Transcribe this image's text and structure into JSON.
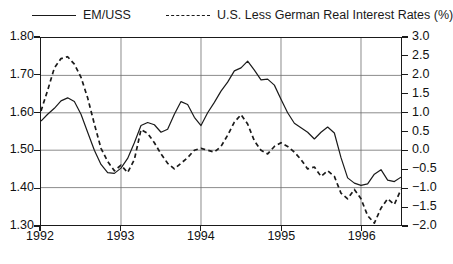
{
  "legend": {
    "entries": [
      {
        "label": "EM/USS",
        "style": "solid",
        "color": "#1a1a1a",
        "name": "legend-entry-emuss"
      },
      {
        "label": "U.S. Less German Real Interest Rates (%)",
        "style": "dashed",
        "color": "#1a1a1a",
        "name": "legend-entry-rates"
      }
    ]
  },
  "chart_data": {
    "type": "line",
    "title": "",
    "subtitle": "",
    "xlabel": "",
    "ylabel": "",
    "grid": true,
    "legend_position": "top",
    "x": [
      1992.0,
      1992.083,
      1992.167,
      1992.25,
      1992.333,
      1992.417,
      1992.5,
      1992.583,
      1992.667,
      1992.75,
      1992.833,
      1992.917,
      1993.0,
      1993.083,
      1993.167,
      1993.25,
      1993.333,
      1993.417,
      1993.5,
      1993.583,
      1993.667,
      1993.75,
      1993.833,
      1993.917,
      1994.0,
      1994.083,
      1994.167,
      1994.25,
      1994.333,
      1994.417,
      1994.5,
      1994.583,
      1994.667,
      1994.75,
      1994.833,
      1994.917,
      1995.0,
      1995.083,
      1995.167,
      1995.25,
      1995.333,
      1995.417,
      1995.5,
      1995.583,
      1995.667,
      1995.75,
      1995.833,
      1995.917,
      1996.0,
      1996.083,
      1996.167,
      1996.25,
      1996.333,
      1996.417,
      1996.5
    ],
    "x_tick_labels": [
      "1992",
      "1993",
      "1994",
      "1995",
      "1996"
    ],
    "x_tick_values": [
      1992,
      1993,
      1994,
      1995,
      1996
    ],
    "xlim": [
      1992.0,
      1996.5
    ],
    "axes": [
      {
        "id": "left",
        "series_name": "EM/USS",
        "ylim": [
          1.3,
          1.8
        ],
        "ticks": [
          1.8,
          1.7,
          1.6,
          1.5,
          1.4,
          1.3
        ],
        "tick_labels": [
          "1.80",
          "1.70",
          "1.60",
          "1.50",
          "1.40",
          "1.30"
        ]
      },
      {
        "id": "right",
        "series_name": "U.S. Less German Real Interest Rates (%)",
        "ylim": [
          -2.0,
          3.0
        ],
        "ticks": [
          3.0,
          2.5,
          2.0,
          1.5,
          1.0,
          0.5,
          0.0,
          -0.5,
          -1.0,
          -1.5,
          -2.0
        ],
        "tick_labels": [
          "3.0",
          "2.5",
          "2.0",
          "1.5",
          "1.0",
          "0.5",
          "0.0",
          "−0.5",
          "−1.0",
          "−1.5",
          "−2.0"
        ]
      }
    ],
    "series": [
      {
        "name": "EM/USS",
        "axis": "left",
        "style": "solid",
        "color": "#1a1a1a",
        "values": [
          1.578,
          1.596,
          1.612,
          1.632,
          1.64,
          1.63,
          1.596,
          1.548,
          1.5,
          1.462,
          1.44,
          1.438,
          1.452,
          1.478,
          1.52,
          1.566,
          1.574,
          1.568,
          1.548,
          1.556,
          1.596,
          1.63,
          1.622,
          1.588,
          1.566,
          1.6,
          1.628,
          1.658,
          1.682,
          1.712,
          1.72,
          1.738,
          1.714,
          1.688,
          1.69,
          1.674,
          1.636,
          1.6,
          1.572,
          1.56,
          1.548,
          1.53,
          1.548,
          1.562,
          1.546,
          1.48,
          1.426,
          1.412,
          1.406,
          1.41,
          1.436,
          1.448,
          1.42,
          1.416,
          1.428
        ]
      },
      {
        "name": "U.S. Less German Real Interest Rates (%)",
        "axis": "right",
        "style": "dashed",
        "color": "#1a1a1a",
        "values": [
          1.05,
          1.6,
          2.2,
          2.45,
          2.5,
          2.3,
          1.95,
          1.4,
          0.7,
          0.05,
          -0.3,
          -0.55,
          -0.4,
          -0.6,
          -0.25,
          0.55,
          0.45,
          0.2,
          -0.1,
          -0.35,
          -0.5,
          -0.35,
          -0.2,
          0.0,
          0.05,
          0.0,
          -0.05,
          0.1,
          0.4,
          0.75,
          0.95,
          0.7,
          0.25,
          0.0,
          -0.1,
          0.1,
          0.2,
          0.1,
          -0.05,
          -0.25,
          -0.5,
          -0.45,
          -0.7,
          -0.55,
          -0.7,
          -1.15,
          -1.3,
          -1.05,
          -1.3,
          -1.75,
          -1.95,
          -1.55,
          -1.3,
          -1.45,
          -1.05
        ]
      }
    ]
  }
}
